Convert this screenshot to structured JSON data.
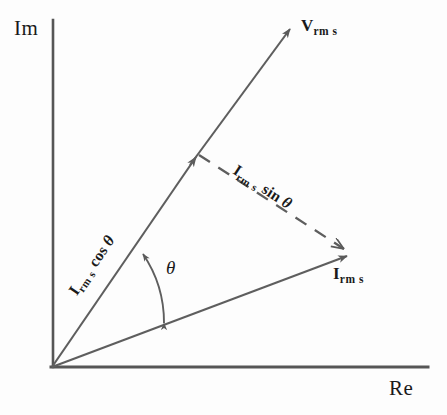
{
  "figure": {
    "type": "phasor-diagram",
    "background_color": "#fdfdfd",
    "line_color": "#555555",
    "text_color": "#1a1a1a"
  },
  "axes": {
    "imaginary": {
      "label": "Im",
      "orientation": "vertical",
      "x": 53,
      "y_top": 20,
      "y_bottom": 367,
      "label_x": 14,
      "label_y": 20
    },
    "real": {
      "label": "Re",
      "orientation": "horizontal",
      "y": 367,
      "x_left": 52,
      "x_right": 428,
      "label_x": 389,
      "label_y": 381
    },
    "origin": {
      "x": 52,
      "y": 367
    }
  },
  "vectors": [
    {
      "name": "V_rms",
      "label_main": "V",
      "label_sub": "rm s",
      "style": "solid",
      "from": {
        "x": 52,
        "y": 367
      },
      "to": {
        "x": 291,
        "y": 28
      },
      "angle_deg": 54.8,
      "label_x": 301,
      "label_y": 16
    },
    {
      "name": "I_rms",
      "label_main": "I",
      "label_sub": "rm s",
      "style": "solid",
      "from": {
        "x": 52,
        "y": 367
      },
      "to": {
        "x": 350,
        "y": 254
      },
      "angle_deg": 20.8,
      "label_x": 333,
      "label_y": 264
    }
  ],
  "projections": [
    {
      "name": "I_rms_cos_theta",
      "label_main": "I",
      "label_sub": "rm s",
      "label_fn": "cos",
      "label_theta": "θ",
      "style": "solid-segment-on-V-axis",
      "from": {
        "x": 52,
        "y": 367
      },
      "to": {
        "x": 196,
        "y": 156
      },
      "rotation_deg": -55.5,
      "anchor_x": 66,
      "anchor_y": 289
    },
    {
      "name": "I_rms_sin_theta",
      "label_main": "I",
      "label_sub": "rm s",
      "label_fn": "sin",
      "label_theta": "θ",
      "style": "dashed",
      "from": {
        "x": 199,
        "y": 155
      },
      "to": {
        "x": 349,
        "y": 253
      },
      "rotation_deg": 33.2,
      "anchor_x": 239,
      "anchor_y": 162
    }
  ],
  "angle_arc": {
    "name": "theta-angle",
    "symbol": "θ",
    "between": [
      "I_rms",
      "V_rms"
    ],
    "radius": 120,
    "start_angle_deg": 20.8,
    "end_angle_deg": 54.8,
    "double_headed": true,
    "symbol_x": 166,
    "symbol_y": 258
  }
}
